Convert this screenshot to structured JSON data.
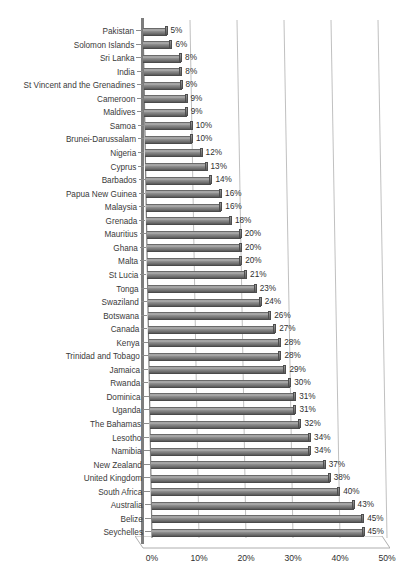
{
  "chart_data": {
    "type": "bar",
    "orientation": "horizontal",
    "title": "",
    "subtitle": "",
    "xlabel": "",
    "ylabel": "",
    "xlim": [
      0,
      50
    ],
    "xtick_labels": [
      "0%",
      "10%",
      "20%",
      "30%",
      "40%",
      "50%"
    ],
    "xticks": [
      0,
      10,
      20,
      30,
      40,
      50
    ],
    "grid": true,
    "grid_axis": "x",
    "legend": false,
    "value_label_suffix": "%",
    "style": "3d-bar",
    "bar_color": "#8c8c8c",
    "gridline_color": "#b9b9b9",
    "axis_color": "#7d7d7d",
    "text_color": "#2f2f2f",
    "categories": [
      "Pakistan",
      "Solomon Islands",
      "Sri Lanka",
      "India",
      "St Vincent and the Grenadines",
      "Cameroon",
      "Maldives",
      "Samoa",
      "Brunei-Darussalam",
      "Nigeria",
      "Cyprus",
      "Barbados",
      "Papua New Guinea",
      "Malaysia",
      "Grenada",
      "Mauritius",
      "Ghana",
      "Malta",
      "St Lucia",
      "Tonga",
      "Swaziland",
      "Botswana",
      "Canada",
      "Kenya",
      "Trinidad and Tobago",
      "Jamaica",
      "Rwanda",
      "Dominica",
      "Uganda",
      "The Bahamas",
      "Lesotho",
      "Namibia",
      "New Zealand",
      "United Kingdom",
      "South Africa",
      "Australia",
      "Belize",
      "Seychelles"
    ],
    "values": [
      5,
      6,
      8,
      8,
      8,
      9,
      9,
      10,
      10,
      12,
      13,
      14,
      16,
      16,
      18,
      20,
      20,
      20,
      21,
      23,
      24,
      26,
      27,
      28,
      28,
      29,
      30,
      31,
      31,
      32,
      34,
      34,
      37,
      38,
      40,
      43,
      45,
      45
    ],
    "value_labels": [
      "5%",
      "6%",
      "8%",
      "8%",
      "8%",
      "9%",
      "9%",
      "10%",
      "10%",
      "12%",
      "13%",
      "14%",
      "16%",
      "16%",
      "18%",
      "20%",
      "20%",
      "20%",
      "21%",
      "23%",
      "24%",
      "26%",
      "27%",
      "28%",
      "28%",
      "29%",
      "30%",
      "31%",
      "31%",
      "32%",
      "34%",
      "34%",
      "37%",
      "38%",
      "40%",
      "43%",
      "45%",
      "45%"
    ]
  }
}
